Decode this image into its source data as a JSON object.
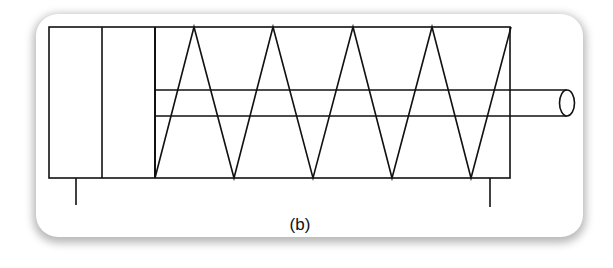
{
  "figure": {
    "caption": "(b)",
    "colors": {
      "stroke": "#111111",
      "card_background": "#ffffff",
      "shadow": "#8a8a8a"
    },
    "parts": [
      {
        "name": "cylinder-body",
        "label": ""
      },
      {
        "name": "piston",
        "label": ""
      },
      {
        "name": "return-spring",
        "label": ""
      },
      {
        "name": "piston-rod",
        "label": ""
      },
      {
        "name": "mounting-leg-left",
        "label": ""
      },
      {
        "name": "mounting-leg-right",
        "label": ""
      }
    ]
  }
}
